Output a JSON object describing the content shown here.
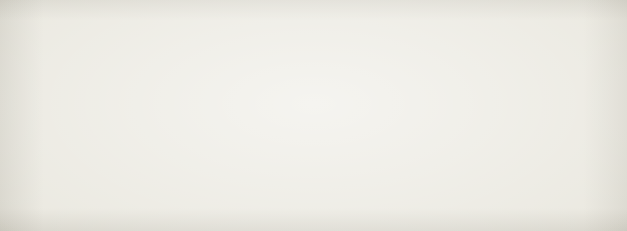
{
  "title": {
    "full": "Table 42 Average strength and cost of UN peacekeeping forces, 1991–1998",
    "visible": "able 42 Average strength and cost of UN peacekeeping forces, 1991–1998",
    "number": "Table 42",
    "caption": "Average strength and cost of UN peacekeeping forces, 1991–1998"
  },
  "header": {
    "year": "Year",
    "year_visible": "ear",
    "troops": "Troops",
    "other": "Other UN Personnel",
    "total": "Total",
    "cost": "UN Costs"
  },
  "colors": {
    "paper": "#e9e7de",
    "ink": "#241f1c",
    "troops_bar": "#6f6d66",
    "other_bar": "#d5d3cb",
    "reverse_text": "#f4f2ec"
  },
  "chart_data": {
    "type": "bar",
    "orientation": "horizontal",
    "stacked": true,
    "title": "Average strength and cost of UN peacekeeping forces, 1991–1998",
    "xlabel": "",
    "ylabel": "Year",
    "categories": [
      "1991",
      "1992",
      "1993",
      "1994",
      "1995",
      "1996",
      "1997",
      "1998"
    ],
    "series": [
      {
        "name": "Troops",
        "color": "#6f6d66",
        "values": [
          9000,
          33000,
          67000,
          72000,
          61000,
          21000,
          20000,
          15000
        ]
      },
      {
        "name": "Other UN Personnel",
        "color": "#d5d3cb",
        "values": [
          5000,
          12000,
          22000,
          13000,
          12000,
          7000,
          10000,
          9000
        ]
      }
    ],
    "totals": [
      14000,
      45000,
      89000,
      85000,
      73000,
      28000,
      30000,
      24000
    ],
    "grid": false,
    "legend": "top"
  },
  "rows": [
    {
      "year": "1991",
      "troops": "9,000",
      "other": "5,000",
      "total": "14,000",
      "cost": "US$380",
      "troops_px": 37,
      "other_px": 16
    },
    {
      "year": "1992",
      "troops": "33,000",
      "other": "12,000",
      "total": "45,000",
      "cost": "US$1,330",
      "troops_px": 127,
      "other_px": 48
    },
    {
      "year": "1993",
      "troops": "67,000",
      "other": "22,000",
      "total": "89,000",
      "cost": "US$3,000",
      "troops_px": 254,
      "other_px": 86
    },
    {
      "year": "1994",
      "troops": "72,000",
      "other": "13,000",
      "total": "85,000",
      "cost": "US$3,400",
      "troops_px": 277,
      "other_px": 52
    },
    {
      "year": "1995",
      "troops": "61,000",
      "other": "12,000",
      "total": "73,000",
      "cost": "US$3,300",
      "troops_px": 232,
      "other_px": 48
    },
    {
      "year": "1996",
      "troops": "21,000",
      "other": "7,000",
      "total": "28,000",
      "cost": "US$1,600",
      "troops_px": 82,
      "other_px": 29
    },
    {
      "year": "1997",
      "troops": "20,000",
      "other": "10,000",
      "total": "30,000",
      "cost": "US$1,300",
      "troops_px": 78,
      "other_px": 40
    },
    {
      "year": "1998",
      "troops": "15,000",
      "other": "9,000",
      "total": "24,000",
      "cost": "US$1,000",
      "troops_px": 59,
      "other_px": 36
    }
  ]
}
